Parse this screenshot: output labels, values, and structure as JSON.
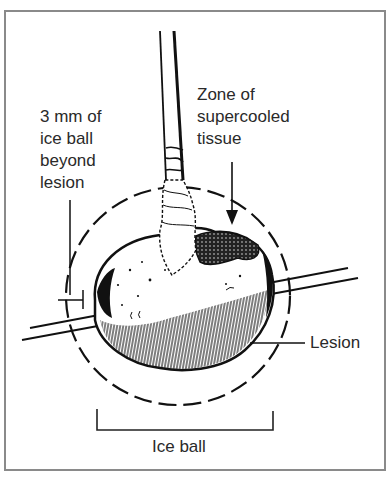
{
  "figure": {
    "labels": {
      "margin": "3 mm of\nice ball\nbeyond\nlesion",
      "zone": "Zone of\nsupercooled\ntissue",
      "lesion": "Lesion",
      "ice_ball": "Ice ball"
    },
    "colors": {
      "ink": "#1a1a1a",
      "frame": "#8a8a8a",
      "background": "#ffffff"
    }
  }
}
